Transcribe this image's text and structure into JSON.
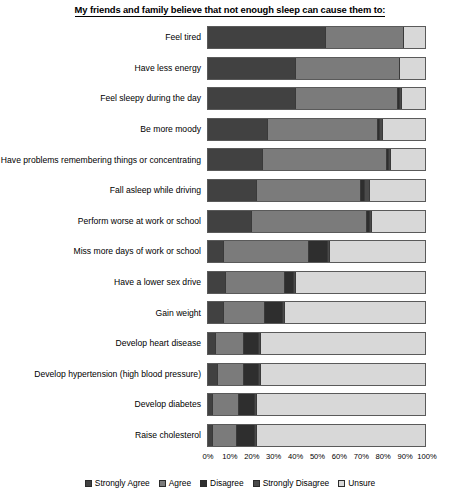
{
  "chart_data": {
    "type": "bar",
    "subtype": "stacked-horizontal-100pct",
    "title": "My friends and family believe that not enough sleep can cause them to:",
    "xlabel": "",
    "ylabel": "",
    "xlim": [
      0,
      100
    ],
    "xticks": [
      0,
      10,
      20,
      30,
      40,
      50,
      60,
      70,
      80,
      90,
      100
    ],
    "xticklabels": [
      "0%",
      "10%",
      "20%",
      "30%",
      "40%",
      "50%",
      "60%",
      "70%",
      "80%",
      "90%",
      "100%"
    ],
    "grid": false,
    "legend_position": "bottom",
    "categories": [
      "Feel tired",
      "Have less energy",
      "Feel sleepy during the day",
      "Be more moody",
      "Have problems remembering things or concentrating",
      "Fall asleep while driving",
      "Perform worse at work or school",
      "Miss more days of work or school",
      "Have a lower sex drive",
      "Gain weight",
      "Develop heart disease",
      "Develop hypertension (high blood pressure)",
      "Develop diabetes",
      "Raise cholesterol"
    ],
    "series": [
      {
        "name": "Strongly Agree",
        "color": "#414141",
        "values": [
          54,
          40,
          40,
          27,
          25,
          22,
          20,
          7,
          8,
          7,
          3,
          4,
          2,
          2
        ]
      },
      {
        "name": "Agree",
        "color": "#7b7b7b",
        "values": [
          36,
          48,
          47,
          51,
          57,
          48,
          53,
          39,
          27,
          19,
          13,
          12,
          12,
          11
        ]
      },
      {
        "name": "Disagree",
        "color": "#2e2e2e",
        "values": [
          0,
          0,
          1,
          1,
          1,
          2,
          1,
          9,
          4,
          8,
          7,
          7,
          7,
          8
        ]
      },
      {
        "name": "Strongly Disagree",
        "color": "#4a4a4a",
        "values": [
          0,
          0,
          1,
          1,
          1,
          2,
          1,
          1,
          1,
          1,
          1,
          1,
          1,
          1
        ]
      },
      {
        "name": "Unsure",
        "color": "#d8d8d8",
        "values": [
          10,
          12,
          11,
          20,
          16,
          26,
          25,
          44,
          60,
          65,
          76,
          76,
          78,
          78
        ]
      }
    ]
  },
  "legend": {
    "items": [
      {
        "label": "Strongly Agree"
      },
      {
        "label": "Agree"
      },
      {
        "label": "Disagree"
      },
      {
        "label": "Strongly Disagree"
      },
      {
        "label": "Unsure"
      }
    ]
  }
}
